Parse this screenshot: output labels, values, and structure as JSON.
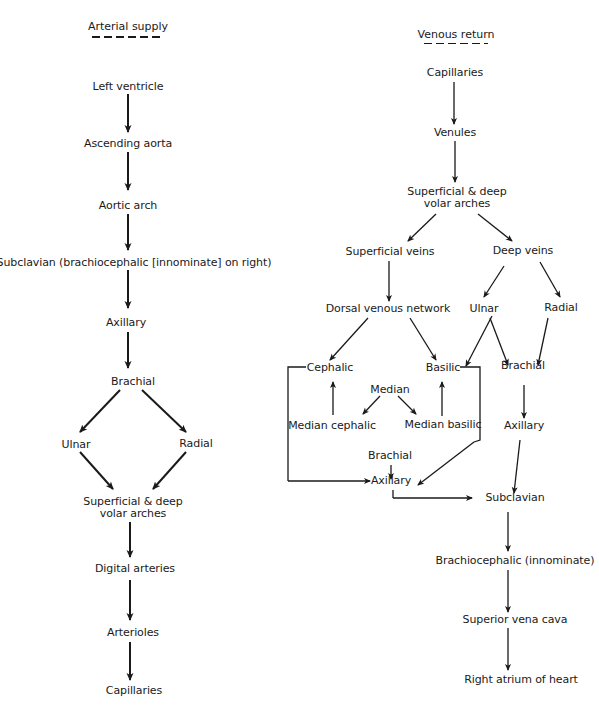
{
  "arterial": {
    "title": "Arterial supply",
    "nodes": {
      "left_ventricle": "Left ventricle",
      "ascending_aorta": "Ascending aorta",
      "aortic_arch": "Aortic arch",
      "subclavian": "Subclavian (brachiocephalic [innominate] on right)",
      "axillary": "Axillary",
      "brachial": "Brachial",
      "ulnar": "Ulnar",
      "radial": "Radial",
      "arches_1": "Superficial & deep",
      "arches_2": "volar arches",
      "digital": "Digital arteries",
      "arterioles": "Arterioles",
      "capillaries": "Capillaries"
    }
  },
  "venous": {
    "title": "Venous return",
    "nodes": {
      "capillaries": "Capillaries",
      "venules": "Venules",
      "arches_1": "Superficial & deep",
      "arches_2": "volar arches",
      "superficial_veins": "Superficial veins",
      "deep_veins": "Deep veins",
      "dorsal_network": "Dorsal venous network",
      "ulnar": "Ulnar",
      "radial": "Radial",
      "cephalic": "Cephalic",
      "basilic": "Basilic",
      "median": "Median",
      "median_cephalic": "Median cephalic",
      "median_basilic": "Median basilic",
      "brachial_superficial": "Brachial",
      "axillary_superficial": "Axillary",
      "brachial_deep": "Brachial",
      "axillary_deep": "Axillary",
      "subclavian": "Subclavian",
      "brachiocephalic": "Brachiocephalic (innominate)",
      "svc": "Superior vena cava",
      "right_atrium": "Right atrium of heart"
    }
  }
}
